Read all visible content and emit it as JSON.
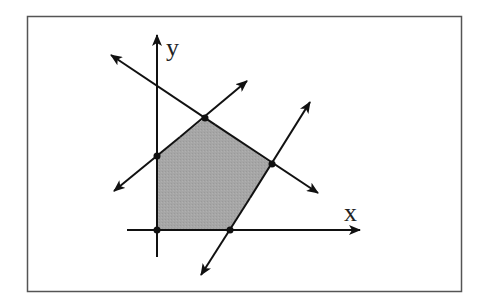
{
  "diagram": {
    "title": "",
    "type": "feasible-region",
    "axes": {
      "x_label": "x",
      "y_label": "y"
    },
    "colors": {
      "frame": "#555555",
      "lines": "#111111",
      "region_fill": "#a6a6a6",
      "background": "#ffffff"
    },
    "region_vertices": [
      {
        "name": "origin",
        "x": 157,
        "y": 230
      },
      {
        "name": "y-intercept",
        "x": 157,
        "y": 156
      },
      {
        "name": "top",
        "x": 205,
        "y": 118
      },
      {
        "name": "right",
        "x": 272,
        "y": 164
      },
      {
        "name": "x-intercept",
        "x": 230,
        "y": 230
      }
    ],
    "constraint_lines": [
      {
        "name": "descending-line",
        "from": [
          111,
          55
        ],
        "to": [
          318,
          193
        ]
      },
      {
        "name": "ascending-line",
        "from": [
          114,
          191
        ],
        "to": [
          247,
          81
        ]
      },
      {
        "name": "steep-line",
        "from": [
          201,
          275
        ],
        "to": [
          310,
          102
        ]
      }
    ]
  }
}
